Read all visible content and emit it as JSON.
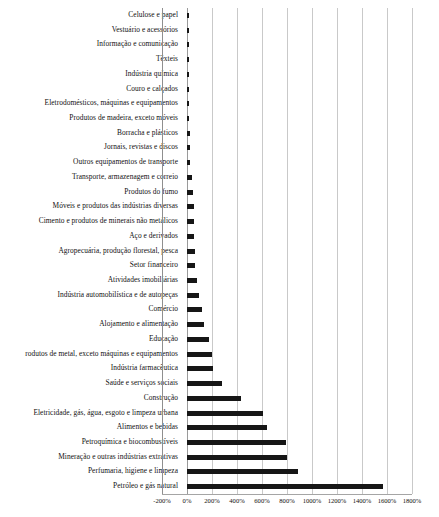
{
  "chart_data": {
    "type": "bar",
    "orientation": "horizontal",
    "title": "",
    "subtitle": "",
    "xlabel": "",
    "ylabel": "",
    "xlim": [
      -200,
      1800
    ],
    "xticks": [
      -200,
      0,
      200,
      400,
      600,
      800,
      1000,
      1200,
      1400,
      1600,
      1800
    ],
    "xtick_labels": [
      "-200%",
      "0%",
      "200%",
      "400%",
      "600%",
      "800%",
      "1000%",
      "1200%",
      "1400%",
      "1600%",
      "1800%"
    ],
    "grid": true,
    "legend": false,
    "bar_color": "#161616",
    "categories": [
      "Celulose e papel",
      "Vestuário e acessórios",
      "Informação e comunicação",
      "Têxteis",
      "Indústria química",
      "Couro e calçados",
      "Eletrodomésticos, máquinas e equipamentos",
      "Produtos de madeira, exceto móveis",
      "Borracha e plásticos",
      "Jornais, revistas e discos",
      "Outros equipamentos de transporte",
      "Transporte, armazenagem e correio",
      "Produtos do fumo",
      "Móveis e produtos das indústrias diversas",
      "Cimento e produtos de minerais não metálicos",
      "Aço e derivados",
      "Agropecuária, produção florestal, pesca",
      "Setor financeiro",
      "Atividades imobiliárias",
      "Indústria automobilística e de autopeças",
      "Comércio",
      "Alojamento e alimentação",
      "Educação",
      "rodutos de metal, exceto máquinas e equipamentos",
      "Indústria farmacêutica",
      "Saúde e serviços sociais",
      "Construção",
      "Eletricidade, gás, água, esgoto e limpeza urbana",
      "Alimentos e bebidas",
      "Petroquímica e biocombustíveis",
      "Mineração e outras indústrias extrativas",
      "Perfumaria, higiene e limpeza",
      "Petróleo e gás natural"
    ],
    "values": [
      16,
      14,
      14,
      8,
      6,
      9,
      18,
      19,
      20,
      22,
      24,
      40,
      46,
      52,
      56,
      58,
      62,
      66,
      78,
      96,
      120,
      136,
      172,
      200,
      210,
      280,
      430,
      610,
      640,
      790,
      800,
      890,
      1570
    ]
  }
}
